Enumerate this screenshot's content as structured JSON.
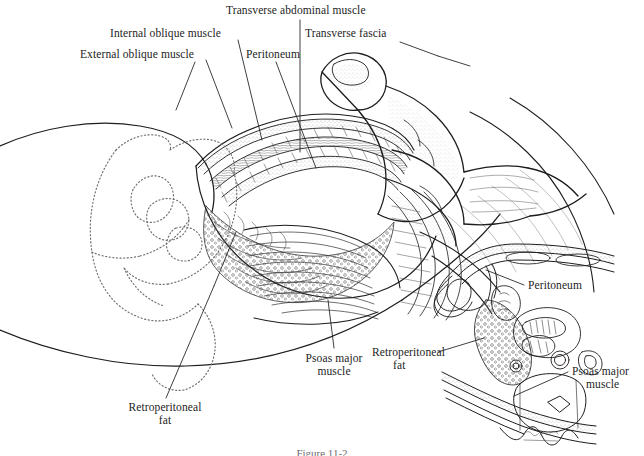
{
  "figure": {
    "caption": "Figure 11-2",
    "artist_signature": "adk"
  },
  "main_labels": [
    {
      "id": "transverse-abdominal-muscle",
      "text": "Transverse abdominal muscle"
    },
    {
      "id": "internal-oblique-muscle",
      "text": "Internal oblique muscle"
    },
    {
      "id": "transverse-fascia",
      "text": "Transverse fascia"
    },
    {
      "id": "external-oblique-muscle",
      "text": "External oblique muscle"
    },
    {
      "id": "peritoneum",
      "text": "Peritoneum"
    },
    {
      "id": "psoas-major-muscle-line1",
      "text": "Psoas major"
    },
    {
      "id": "psoas-major-muscle-line2",
      "text": "muscle"
    },
    {
      "id": "retroperitoneal-fat-line1",
      "text": "Retroperitoneal"
    },
    {
      "id": "retroperitoneal-fat-line2",
      "text": "fat"
    }
  ],
  "inset_labels": [
    {
      "id": "inset-peritoneum",
      "text": "Peritoneum"
    },
    {
      "id": "inset-retroperitoneal-fat-line1",
      "text": "Retroperitoneal"
    },
    {
      "id": "inset-retroperitoneal-fat-line2",
      "text": "fat"
    },
    {
      "id": "inset-psoas-major-line1",
      "text": "Psoas major"
    },
    {
      "id": "inset-psoas-major-line2",
      "text": "muscle"
    }
  ],
  "colors": {
    "ink": "#1d1d1d",
    "paper": "#ffffff",
    "hatch": "#4a4a4a",
    "faint": "#8e8e8e",
    "caption": "#6d6d6d"
  }
}
